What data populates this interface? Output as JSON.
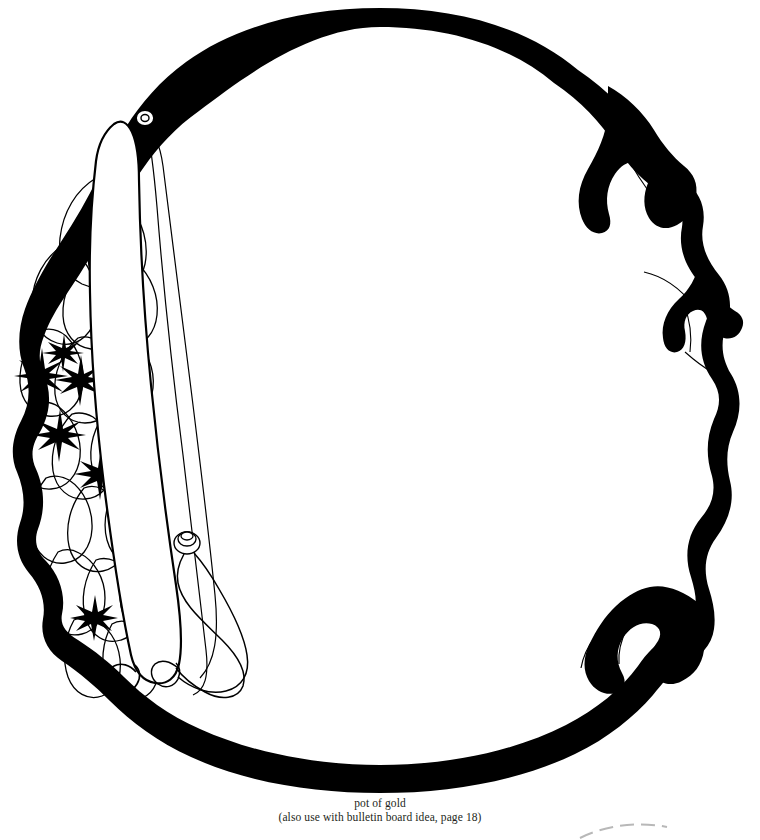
{
  "page": {
    "background_color": "#ffffff",
    "ink_color": "#000000",
    "caption_color": "#231f20",
    "width": 760,
    "height": 840
  },
  "artwork": {
    "title": "pot of gold",
    "description": "Black line-art clip-art pattern of a large round pot of gold with a carrying strap, gold nuggets and sparkles on the left, and small lobed handles around the rim.",
    "style": "black-and-white line drawing / coloring pattern",
    "parts": {
      "pot_body": "pot-body-outline",
      "strap": "vertical-handle-strap",
      "gold_pile": "gold-nuggets-pile",
      "sparkles": "sparkle-stars",
      "top_ring": "top-hanging-ring",
      "bottom_hook": "bottom-hook-curl",
      "knob": "hook-knob",
      "right_lobes": "right-side-lobes",
      "bottom_lobes": "bottom-right-lobes",
      "corner_mark": "bottom-right-corner-arc"
    },
    "sparkle_count": 6,
    "nugget_count": 14
  },
  "caption": {
    "line1": "pot of gold",
    "line2": "(also use with bulletin board idea, page 18)",
    "page_reference": "18"
  }
}
